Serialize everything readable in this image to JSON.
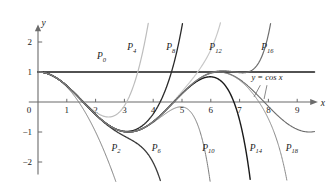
{
  "chart_data": {
    "type": "line",
    "title": "",
    "xlabel": "x",
    "ylabel": "y",
    "xlim": [
      -0.3,
      9.6
    ],
    "ylim": [
      -2.4,
      2.4
    ],
    "grid": false,
    "legend_position": "inline-labels",
    "x_ticks": [
      "0",
      "1",
      "2",
      "3",
      "4",
      "5",
      "6",
      "7",
      "8",
      "9"
    ],
    "x_tick_values": [
      0,
      1,
      2,
      3,
      4,
      5,
      6,
      7,
      8,
      9
    ],
    "y_ticks": [
      "2",
      "1",
      "−1",
      "−2"
    ],
    "y_tick_values": [
      2,
      1,
      -1,
      -2
    ],
    "annotations": [
      {
        "name": "cos-curve-label",
        "text": "y = cos x",
        "x": 7.95,
        "y": 0.72
      }
    ],
    "series": [
      {
        "name": "P_0",
        "label": "P",
        "subscript": "0",
        "color": "#1a1a1a",
        "width": 1.5,
        "label_x": 2.05,
        "label_y": 1.42,
        "description": "Taylor polynomial degree 0 of cos x: constant y = 1"
      },
      {
        "name": "P_2",
        "label": "P",
        "subscript": "2",
        "color": "#7d7d7d",
        "width": 1.0,
        "label_x": 2.55,
        "label_y": -1.62,
        "description": "Taylor polynomial degree 2 of cos x: 1 - x^2/2"
      },
      {
        "name": "P_4",
        "label": "P",
        "subscript": "4",
        "color": "#bdbdbd",
        "width": 1.2,
        "label_x": 3.1,
        "label_y": 1.73,
        "description": "Taylor polynomial degree 4 of cos x: 1 - x^2/2 + x^4/24"
      },
      {
        "name": "P_6",
        "label": "P",
        "subscript": "6",
        "color": "#3a3a3a",
        "width": 1.3,
        "label_x": 3.95,
        "label_y": -1.62,
        "description": "Taylor polynomial degree 6 of cos x"
      },
      {
        "name": "P_8",
        "label": "P",
        "subscript": "8",
        "color": "#2a2a2a",
        "width": 1.3,
        "label_x": 4.45,
        "label_y": 1.73,
        "description": "Taylor polynomial degree 8 of cos x"
      },
      {
        "name": "P_10",
        "label": "P",
        "subscript": "10",
        "color": "#7d7d7d",
        "width": 1.0,
        "label_x": 5.7,
        "label_y": -1.62,
        "description": "Taylor polynomial degree 10 of cos x"
      },
      {
        "name": "P_12",
        "label": "P",
        "subscript": "12",
        "color": "#c8c8c8",
        "width": 1.2,
        "label_x": 5.95,
        "label_y": 1.73,
        "description": "Taylor polynomial degree 12 of cos x"
      },
      {
        "name": "P_14",
        "label": "P",
        "subscript": "14",
        "color": "#1a1a1a",
        "width": 1.4,
        "label_x": 7.35,
        "label_y": -1.62,
        "description": "Taylor polynomial degree 14 of cos x"
      },
      {
        "name": "P_16",
        "label": "P",
        "subscript": "16",
        "color": "#6e6e6e",
        "width": 1.2,
        "label_x": 7.75,
        "label_y": 1.73,
        "description": "Taylor polynomial degree 16 of cos x"
      },
      {
        "name": "P_18",
        "label": "P",
        "subscript": "18",
        "color": "#8a8a8a",
        "width": 1.0,
        "label_x": 8.6,
        "label_y": -1.62,
        "description": "Taylor polynomial degree 18 of cos x"
      },
      {
        "name": "cos",
        "label": "y = cos x",
        "subscript": "",
        "color": "#6b6b6b",
        "width": 1.1,
        "label_x": 7.95,
        "label_y": 0.72,
        "description": "The function y = cos x"
      }
    ]
  },
  "axes": {
    "y_axis_name": "y",
    "x_axis_name": "x",
    "origin_label": "0"
  }
}
